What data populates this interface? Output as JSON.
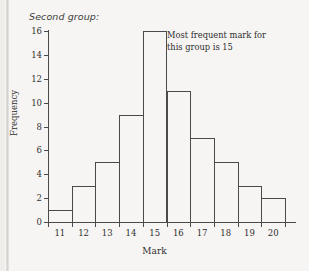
{
  "title": "Second group:",
  "annotation": {
    "line1": "Most frequent mark for",
    "line2": "this group is 15"
  },
  "colors": {
    "background": "#f6f5f3",
    "line": "#4a4a4a",
    "text": "#2f2f2f"
  },
  "chart_data": {
    "type": "bar",
    "title": "Second group:",
    "xlabel": "Mark",
    "ylabel": "Frequency",
    "categories": [
      "11",
      "12",
      "13",
      "14",
      "15",
      "16",
      "17",
      "18",
      "19",
      "20"
    ],
    "values": [
      1,
      3,
      5,
      9,
      16,
      11,
      7,
      5,
      3,
      2
    ],
    "ylim": [
      0,
      16
    ],
    "xlim": [
      10.5,
      20.5
    ],
    "yticks": [
      0,
      2,
      4,
      6,
      8,
      10,
      12,
      14,
      16
    ],
    "ytick_labels": [
      "0",
      "2",
      "4",
      "6",
      "8",
      "10",
      "12",
      "14",
      "16"
    ],
    "xtick_labels": [
      "11",
      "12",
      "13",
      "14",
      "15",
      "16",
      "17",
      "18",
      "19",
      "20"
    ],
    "grid": false,
    "legend": null,
    "annotations": [
      "Most frequent mark for this group is 15"
    ],
    "style": "histogram-outline"
  }
}
